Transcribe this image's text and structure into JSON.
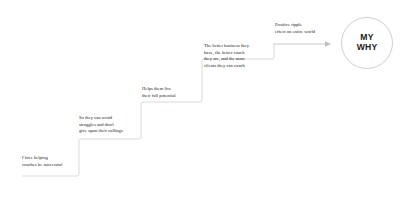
{
  "diagram": {
    "type": "staircase-flow",
    "background_color": "#ffffff",
    "line_color": "#d5d5d5",
    "text_color": "#1b1b1b",
    "steps": [
      {
        "index": 1,
        "label": "I love helping\ncoaches be successful"
      },
      {
        "index": 2,
        "label": "So they can avoid\nstruggles and don't\ngive upon their callings"
      },
      {
        "index": 3,
        "label": "Helps them live\ntheir full potential"
      },
      {
        "index": 4,
        "label": "The better business they\nhave, the better coach\nthey are, and the more\nclients they can coach"
      },
      {
        "index": 5,
        "label": "Positive ripple\neffect on entire world"
      }
    ],
    "terminal": {
      "line1": "MY",
      "line2": "WHY",
      "shape": "circle",
      "border_color": "#cfcfcf"
    },
    "arrow": {
      "direction": "right",
      "color": "#b9b9b9"
    }
  }
}
